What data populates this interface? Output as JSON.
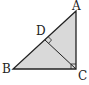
{
  "diagram": {
    "type": "geometry",
    "points": {
      "A": {
        "label": "A",
        "x": 76,
        "y": 11
      },
      "B": {
        "label": "B",
        "x": 13,
        "y": 69
      },
      "C": {
        "label": "C",
        "x": 76,
        "y": 69
      },
      "D": {
        "label": "D",
        "x": 45,
        "y": 40
      }
    },
    "segments": [
      "AB",
      "BC",
      "CA",
      "CD"
    ],
    "right_angles": [
      "ACB",
      "CDA"
    ],
    "fill_color": "#d9d9d9",
    "stroke_color": "#222222"
  }
}
